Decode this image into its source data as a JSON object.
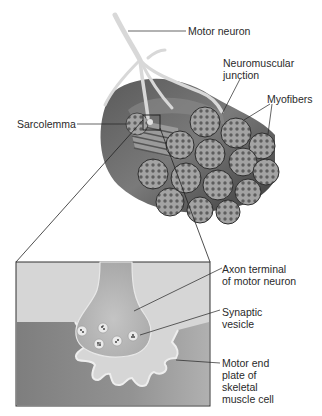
{
  "diagram": {
    "type": "anatomical-illustration",
    "subject": "Neuromuscular junction",
    "labels": {
      "motor_neuron": "Motor neuron",
      "neuromuscular_junction": [
        "Neuromuscular",
        "junction"
      ],
      "myofibers": "Myofibers",
      "sarcolemma": "Sarcolemma",
      "axon_terminal": [
        "Axon terminal",
        "of motor neuron"
      ],
      "synaptic_vesicle": [
        "Synaptic",
        "vesicle"
      ],
      "motor_end_plate": [
        "Motor end",
        "plate of",
        "skeletal",
        "muscle cell"
      ]
    },
    "colors": {
      "muscle_dark": "#4a4a4a",
      "muscle_mid": "#6e6e6e",
      "fiber_fill": "#9a9a9a",
      "fiber_dots": "#5c5c5c",
      "neuron": "#d9d9d9",
      "inset_bg": "#d4d4d4",
      "inset_muscle": "#8c8c8c",
      "terminal": "#b9b9b9",
      "cleft": "#e6e6e6"
    }
  }
}
